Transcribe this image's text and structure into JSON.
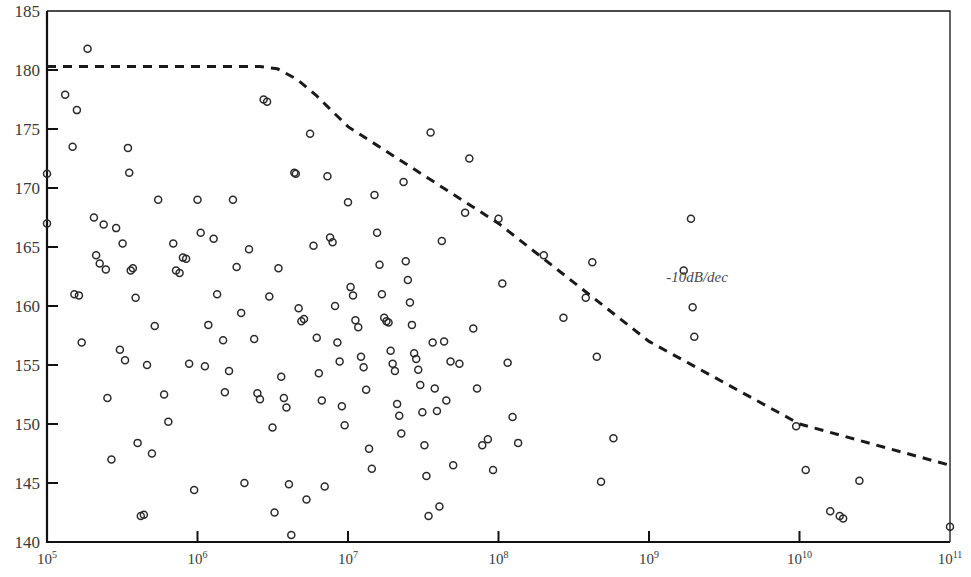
{
  "chart_data": {
    "type": "scatter",
    "title": "",
    "xlabel": "",
    "ylabel": "",
    "xscale": "log",
    "yscale": "linear",
    "xlim": [
      100000,
      100000000000
    ],
    "ylim": [
      140,
      185
    ],
    "grid": false,
    "legend": null,
    "x_ticks": [
      {
        "value": 100000,
        "label": "10",
        "exp": "5"
      },
      {
        "value": 1000000,
        "label": "10",
        "exp": "6"
      },
      {
        "value": 10000000,
        "label": "10",
        "exp": "7"
      },
      {
        "value": 100000000,
        "label": "10",
        "exp": "8"
      },
      {
        "value": 1000000000,
        "label": "10",
        "exp": "9"
      },
      {
        "value": 10000000000,
        "label": "10",
        "exp": "10"
      },
      {
        "value": 100000000000,
        "label": "10",
        "exp": "11"
      }
    ],
    "y_ticks": [
      140,
      145,
      150,
      155,
      160,
      165,
      170,
      175,
      180,
      185
    ],
    "y_tick_labels": [
      "140",
      "145",
      "150",
      "155",
      "160",
      "165",
      "170",
      "175",
      "180",
      "185"
    ],
    "annotations": [
      {
        "text": "-10dB/dec",
        "x": 2400000000,
        "y": 162.3,
        "style": "italic"
      }
    ],
    "reference_line": {
      "name": "mask",
      "style": "dashed",
      "color": "#1a1a1a",
      "width": 3,
      "label": "-10dB/dec",
      "points": [
        {
          "x": 100000,
          "y": 180.3
        },
        {
          "x": 2600000,
          "y": 180.3
        },
        {
          "x": 3400000,
          "y": 180.1
        },
        {
          "x": 4600000,
          "y": 179.2
        },
        {
          "x": 6200000,
          "y": 177.8
        },
        {
          "x": 10000000,
          "y": 175.2
        },
        {
          "x": 100000000,
          "y": 167.0
        },
        {
          "x": 1000000000,
          "y": 157.0
        },
        {
          "x": 10000000000,
          "y": 150.0
        },
        {
          "x": 100000000000,
          "y": 146.5
        }
      ]
    },
    "series": [
      {
        "name": "measurements",
        "marker": "open-circle",
        "marker_size": 7,
        "color": "#2b2b2b",
        "points": [
          {
            "x": 100000,
            "y": 171.2
          },
          {
            "x": 100000,
            "y": 167.0
          },
          {
            "x": 132000,
            "y": 177.9
          },
          {
            "x": 148000,
            "y": 173.5
          },
          {
            "x": 152000,
            "y": 161.0
          },
          {
            "x": 158000,
            "y": 176.6
          },
          {
            "x": 163000,
            "y": 160.9
          },
          {
            "x": 170000,
            "y": 156.9
          },
          {
            "x": 186000,
            "y": 181.8
          },
          {
            "x": 205000,
            "y": 167.5
          },
          {
            "x": 212000,
            "y": 164.3
          },
          {
            "x": 224000,
            "y": 163.6
          },
          {
            "x": 238000,
            "y": 166.9
          },
          {
            "x": 246000,
            "y": 163.1
          },
          {
            "x": 252000,
            "y": 152.2
          },
          {
            "x": 268000,
            "y": 147.0
          },
          {
            "x": 288000,
            "y": 166.6
          },
          {
            "x": 305000,
            "y": 156.3
          },
          {
            "x": 318000,
            "y": 165.3
          },
          {
            "x": 330000,
            "y": 155.4
          },
          {
            "x": 345000,
            "y": 173.4
          },
          {
            "x": 352000,
            "y": 171.3
          },
          {
            "x": 360000,
            "y": 163.0
          },
          {
            "x": 372000,
            "y": 163.2
          },
          {
            "x": 388000,
            "y": 160.7
          },
          {
            "x": 400000,
            "y": 148.4
          },
          {
            "x": 420000,
            "y": 142.2
          },
          {
            "x": 440000,
            "y": 142.3
          },
          {
            "x": 462000,
            "y": 155.0
          },
          {
            "x": 498000,
            "y": 147.5
          },
          {
            "x": 520000,
            "y": 158.3
          },
          {
            "x": 548000,
            "y": 169.0
          },
          {
            "x": 600000,
            "y": 152.5
          },
          {
            "x": 640000,
            "y": 150.2
          },
          {
            "x": 690000,
            "y": 165.3
          },
          {
            "x": 720000,
            "y": 163.0
          },
          {
            "x": 760000,
            "y": 162.8
          },
          {
            "x": 800000,
            "y": 164.1
          },
          {
            "x": 840000,
            "y": 164.0
          },
          {
            "x": 880000,
            "y": 155.1
          },
          {
            "x": 950000,
            "y": 144.4
          },
          {
            "x": 1000000,
            "y": 169.0
          },
          {
            "x": 1050000,
            "y": 166.2
          },
          {
            "x": 1120000,
            "y": 154.9
          },
          {
            "x": 1180000,
            "y": 158.4
          },
          {
            "x": 1280000,
            "y": 165.7
          },
          {
            "x": 1350000,
            "y": 161.0
          },
          {
            "x": 1480000,
            "y": 157.1
          },
          {
            "x": 1520000,
            "y": 152.7
          },
          {
            "x": 1620000,
            "y": 154.5
          },
          {
            "x": 1720000,
            "y": 169.0
          },
          {
            "x": 1820000,
            "y": 163.3
          },
          {
            "x": 1950000,
            "y": 159.4
          },
          {
            "x": 2050000,
            "y": 145.0
          },
          {
            "x": 2200000,
            "y": 164.8
          },
          {
            "x": 2380000,
            "y": 157.2
          },
          {
            "x": 2500000,
            "y": 152.6
          },
          {
            "x": 2600000,
            "y": 152.1
          },
          {
            "x": 2750000,
            "y": 177.5
          },
          {
            "x": 2900000,
            "y": 177.3
          },
          {
            "x": 3000000,
            "y": 160.8
          },
          {
            "x": 3150000,
            "y": 149.7
          },
          {
            "x": 3250000,
            "y": 142.5
          },
          {
            "x": 3450000,
            "y": 163.2
          },
          {
            "x": 3600000,
            "y": 154.0
          },
          {
            "x": 3750000,
            "y": 152.2
          },
          {
            "x": 3900000,
            "y": 151.4
          },
          {
            "x": 4050000,
            "y": 144.9
          },
          {
            "x": 4200000,
            "y": 140.6
          },
          {
            "x": 4400000,
            "y": 171.3
          },
          {
            "x": 4500000,
            "y": 171.2
          },
          {
            "x": 4700000,
            "y": 159.8
          },
          {
            "x": 4900000,
            "y": 158.7
          },
          {
            "x": 5100000,
            "y": 158.9
          },
          {
            "x": 5300000,
            "y": 143.6
          },
          {
            "x": 5600000,
            "y": 174.6
          },
          {
            "x": 5900000,
            "y": 165.1
          },
          {
            "x": 6200000,
            "y": 157.3
          },
          {
            "x": 6400000,
            "y": 154.3
          },
          {
            "x": 6700000,
            "y": 152.0
          },
          {
            "x": 7000000,
            "y": 144.7
          },
          {
            "x": 7300000,
            "y": 171.0
          },
          {
            "x": 7600000,
            "y": 165.8
          },
          {
            "x": 7900000,
            "y": 165.4
          },
          {
            "x": 8200000,
            "y": 160.0
          },
          {
            "x": 8500000,
            "y": 156.9
          },
          {
            "x": 8800000,
            "y": 155.3
          },
          {
            "x": 9100000,
            "y": 151.5
          },
          {
            "x": 9500000,
            "y": 149.9
          },
          {
            "x": 10000000,
            "y": 168.8
          },
          {
            "x": 10400000,
            "y": 161.6
          },
          {
            "x": 10800000,
            "y": 160.9
          },
          {
            "x": 11200000,
            "y": 158.8
          },
          {
            "x": 11700000,
            "y": 158.2
          },
          {
            "x": 12200000,
            "y": 155.7
          },
          {
            "x": 12700000,
            "y": 154.8
          },
          {
            "x": 13200000,
            "y": 152.9
          },
          {
            "x": 13800000,
            "y": 147.9
          },
          {
            "x": 14400000,
            "y": 146.2
          },
          {
            "x": 15000000,
            "y": 169.4
          },
          {
            "x": 15600000,
            "y": 166.2
          },
          {
            "x": 16200000,
            "y": 163.5
          },
          {
            "x": 16800000,
            "y": 161.0
          },
          {
            "x": 17400000,
            "y": 159.0
          },
          {
            "x": 18000000,
            "y": 158.7
          },
          {
            "x": 18600000,
            "y": 158.6
          },
          {
            "x": 19200000,
            "y": 156.2
          },
          {
            "x": 19800000,
            "y": 155.1
          },
          {
            "x": 20500000,
            "y": 154.5
          },
          {
            "x": 21200000,
            "y": 151.7
          },
          {
            "x": 21900000,
            "y": 150.7
          },
          {
            "x": 22600000,
            "y": 149.2
          },
          {
            "x": 23400000,
            "y": 170.5
          },
          {
            "x": 24200000,
            "y": 163.8
          },
          {
            "x": 25000000,
            "y": 162.2
          },
          {
            "x": 25800000,
            "y": 160.3
          },
          {
            "x": 26600000,
            "y": 158.4
          },
          {
            "x": 27500000,
            "y": 156.0
          },
          {
            "x": 28400000,
            "y": 155.5
          },
          {
            "x": 29300000,
            "y": 154.6
          },
          {
            "x": 30200000,
            "y": 153.3
          },
          {
            "x": 31200000,
            "y": 151.0
          },
          {
            "x": 32200000,
            "y": 148.2
          },
          {
            "x": 33200000,
            "y": 145.6
          },
          {
            "x": 34300000,
            "y": 142.2
          },
          {
            "x": 35400000,
            "y": 174.7
          },
          {
            "x": 36500000,
            "y": 156.9
          },
          {
            "x": 37700000,
            "y": 153.0
          },
          {
            "x": 39000000,
            "y": 151.1
          },
          {
            "x": 40500000,
            "y": 143.0
          },
          {
            "x": 42000000,
            "y": 165.5
          },
          {
            "x": 43500000,
            "y": 157.0
          },
          {
            "x": 45000000,
            "y": 152.0
          },
          {
            "x": 48000000,
            "y": 155.3
          },
          {
            "x": 50000000,
            "y": 146.5
          },
          {
            "x": 55000000,
            "y": 155.1
          },
          {
            "x": 60000000,
            "y": 167.9
          },
          {
            "x": 64000000,
            "y": 172.5
          },
          {
            "x": 68000000,
            "y": 158.1
          },
          {
            "x": 72000000,
            "y": 153.0
          },
          {
            "x": 78000000,
            "y": 148.2
          },
          {
            "x": 85000000,
            "y": 148.7
          },
          {
            "x": 92000000,
            "y": 146.1
          },
          {
            "x": 100000000,
            "y": 167.4
          },
          {
            "x": 106000000,
            "y": 161.9
          },
          {
            "x": 115000000,
            "y": 155.2
          },
          {
            "x": 124000000,
            "y": 150.6
          },
          {
            "x": 135000000,
            "y": 148.4
          },
          {
            "x": 200000000,
            "y": 164.3
          },
          {
            "x": 270000000,
            "y": 159.0
          },
          {
            "x": 380000000,
            "y": 160.7
          },
          {
            "x": 420000000,
            "y": 163.7
          },
          {
            "x": 450000000,
            "y": 155.7
          },
          {
            "x": 480000000,
            "y": 145.1
          },
          {
            "x": 580000000,
            "y": 148.8
          },
          {
            "x": 1700000000,
            "y": 163.0
          },
          {
            "x": 1900000000,
            "y": 167.4
          },
          {
            "x": 1950000000,
            "y": 159.9
          },
          {
            "x": 2000000000,
            "y": 157.4
          },
          {
            "x": 9500000000,
            "y": 149.8
          },
          {
            "x": 11000000000,
            "y": 146.1
          },
          {
            "x": 16000000000,
            "y": 142.6
          },
          {
            "x": 18500000000,
            "y": 142.2
          },
          {
            "x": 19500000000,
            "y": 142.0
          },
          {
            "x": 25000000000,
            "y": 145.2
          },
          {
            "x": 100000000000,
            "y": 141.3
          }
        ]
      }
    ]
  },
  "axes": {
    "frame_color": "#111111",
    "tick_color": "#111111"
  }
}
